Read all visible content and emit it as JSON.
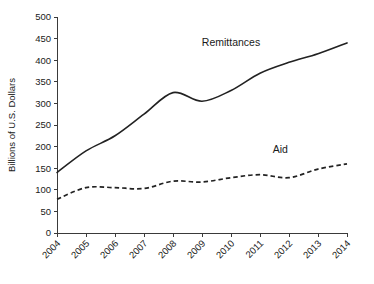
{
  "chart_data": {
    "type": "line",
    "title": "",
    "xlabel": "",
    "ylabel": "Billions of U.S. Dollars",
    "x": [
      2004,
      2005,
      2006,
      2007,
      2008,
      2009,
      2010,
      2011,
      2012,
      2013,
      2014
    ],
    "categories": [
      "2004",
      "2005",
      "2006",
      "2007",
      "2008",
      "2009",
      "2010",
      "2011",
      "2012",
      "2013",
      "2014"
    ],
    "xlim": [
      2004,
      2014
    ],
    "ylim": [
      0,
      500
    ],
    "yticks": [
      0,
      50,
      100,
      150,
      200,
      250,
      300,
      350,
      400,
      450,
      500
    ],
    "ytick_labels": [
      "0",
      "50",
      "100",
      "150",
      "200",
      "250",
      "300",
      "350",
      "400",
      "450",
      "500"
    ],
    "xtick_labels": [
      "2004",
      "2005",
      "2006",
      "2007",
      "2008",
      "2009",
      "2010",
      "2011",
      "2012",
      "2013",
      "2014"
    ],
    "grid": false,
    "legend_position": "inline-annotation",
    "series": [
      {
        "name": "Remittances",
        "style": "solid",
        "color": "#222222",
        "label_x": 2010.0,
        "label_y": 432,
        "values": [
          140,
          190,
          225,
          275,
          325,
          305,
          330,
          370,
          395,
          415,
          440
        ]
      },
      {
        "name": "Aid",
        "style": "dashed",
        "color": "#222222",
        "label_x": 2011.7,
        "label_y": 185,
        "values": [
          78,
          105,
          105,
          103,
          120,
          118,
          128,
          135,
          128,
          148,
          160
        ]
      }
    ],
    "annotations": [
      {
        "text": "Remittances",
        "x": 2010.0,
        "y": 432
      },
      {
        "text": "Aid",
        "x": 2011.7,
        "y": 185
      }
    ]
  },
  "colors": {
    "background": "#ffffff",
    "axis": "#3a3a3a",
    "text": "#1a1a1a",
    "series": "#222222"
  }
}
